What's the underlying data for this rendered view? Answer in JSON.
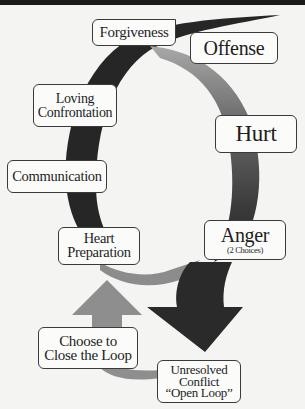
{
  "diagram": {
    "type": "cycle",
    "colors": {
      "background": "#f4f4f2",
      "dark_band": "#262626",
      "mid_band": "#5a5a5a",
      "light_band": "#9a9a9a",
      "box_fill": "#fbfbfa",
      "box_border": "#3a3a3a",
      "text": "#1e1e1e"
    },
    "nodes": [
      {
        "id": "forgiveness",
        "lines": [
          "Forgiveness"
        ]
      },
      {
        "id": "offense",
        "lines": [
          "Offense"
        ]
      },
      {
        "id": "loving-confrontation",
        "lines": [
          "Loving",
          "Confrontation"
        ]
      },
      {
        "id": "hurt",
        "lines": [
          "Hurt"
        ]
      },
      {
        "id": "communication",
        "lines": [
          "Communication"
        ]
      },
      {
        "id": "heart-preparation",
        "lines": [
          "Heart",
          "Preparation"
        ]
      },
      {
        "id": "anger",
        "lines": [
          "Anger"
        ],
        "subtitle": "(2 Choices)"
      },
      {
        "id": "choose-to-close",
        "lines": [
          "Choose to",
          "Close the Loop"
        ]
      },
      {
        "id": "unresolved-conflict",
        "lines": [
          "Unresolved",
          "Conflict",
          "“Open Loop”"
        ]
      }
    ],
    "edges": [
      {
        "from": "offense",
        "to": "hurt"
      },
      {
        "from": "hurt",
        "to": "anger"
      },
      {
        "from": "anger",
        "to": "unresolved-conflict",
        "label": ""
      },
      {
        "from": "anger",
        "to": "heart-preparation"
      },
      {
        "from": "unresolved-conflict",
        "to": "choose-to-close"
      },
      {
        "from": "choose-to-close",
        "to": "heart-preparation"
      },
      {
        "from": "heart-preparation",
        "to": "communication"
      },
      {
        "from": "communication",
        "to": "loving-confrontation"
      },
      {
        "from": "loving-confrontation",
        "to": "forgiveness"
      },
      {
        "from": "forgiveness",
        "to": "offense"
      }
    ]
  }
}
